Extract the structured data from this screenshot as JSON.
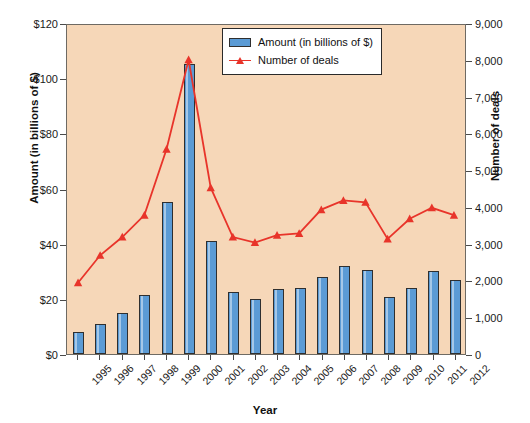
{
  "chart_data": {
    "type": "bar",
    "title": "",
    "xlabel": "Year",
    "ylabel": "Amount (in billions of $)",
    "ylabel_secondary": "Number of deals",
    "grid": false,
    "legend_position": "top-right",
    "categories": [
      "1995",
      "1996",
      "1997",
      "1998",
      "1999",
      "2000",
      "2001",
      "2002",
      "2003",
      "2004",
      "2005",
      "2006",
      "2007",
      "2008",
      "2009",
      "2010",
      "2011",
      "2012"
    ],
    "ylim": [
      0,
      120
    ],
    "yticks": [
      "$0",
      "$20",
      "$40",
      "$60",
      "$80",
      "$100",
      "$120"
    ],
    "ytick_values": [
      0,
      20,
      40,
      60,
      80,
      100,
      120
    ],
    "ylim_secondary": [
      0,
      9000
    ],
    "yticks_secondary": [
      "0",
      "1,000",
      "2,000",
      "3,000",
      "4,000",
      "5,000",
      "6,000",
      "7,000",
      "8,000",
      "9,000"
    ],
    "ytick_values_secondary": [
      0,
      1000,
      2000,
      3000,
      4000,
      5000,
      6000,
      7000,
      8000,
      9000
    ],
    "series": [
      {
        "name": "Amount (in billions of $)",
        "type": "bar",
        "axis": "left",
        "color": "#5b9bd5",
        "values": [
          8,
          11,
          15,
          21.5,
          55,
          105,
          41,
          22.5,
          20,
          23.5,
          24,
          28,
          32,
          30.5,
          20.5,
          24,
          30,
          27
        ]
      },
      {
        "name": "Number of deals",
        "type": "line",
        "axis": "right",
        "color": "#e8342a",
        "values": [
          1950,
          2700,
          3200,
          3800,
          5600,
          8050,
          4550,
          3200,
          3050,
          3250,
          3300,
          3950,
          4200,
          4150,
          3150,
          3700,
          4000,
          3800
        ]
      }
    ]
  },
  "legend": {
    "items": [
      {
        "label": "Amount (in billions of $)",
        "marker": "bar-swatch"
      },
      {
        "label": "Number of deals",
        "marker": "line-marker"
      }
    ]
  },
  "colors": {
    "bar": "#5b9bd5",
    "line": "#e8342a",
    "plot_background": "#f6d7b8",
    "page_background": "#ffffff",
    "axis": "#4a4a4a"
  }
}
